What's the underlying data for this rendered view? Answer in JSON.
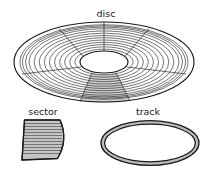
{
  "figure": {
    "background_color": "#ffffff",
    "line_color": "#1a1a1a",
    "shade_color": "#c9c9c9",
    "width": 212,
    "height": 178
  },
  "labels": {
    "disc": "disc",
    "sector": "sector",
    "track": "track"
  },
  "disc": {
    "label": "disc",
    "center_x": 104,
    "center_y": 62,
    "outer_rx": 90,
    "outer_ry": 40,
    "hub_rx": 24,
    "hub_ry": 11,
    "ring_count": 13,
    "radial_count": 6,
    "highlighted_sector": "bottom-center"
  },
  "sector": {
    "label": "sector",
    "apex_x": 22,
    "apex_y": 160,
    "fill": "#bdbdbd",
    "hatch_count": 11
  },
  "track": {
    "label": "track",
    "center_x": 150,
    "center_y": 143,
    "rx": 49,
    "ry": 22,
    "band_width": 3,
    "fill": "#b8b8b8"
  }
}
